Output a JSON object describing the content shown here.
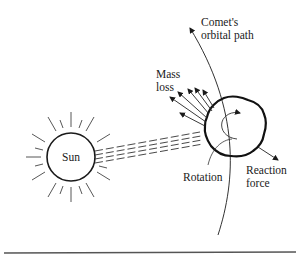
{
  "diagram": {
    "labels": {
      "sun": "Sun",
      "orbital_path_line1": "Comet's",
      "orbital_path_line2": "orbital path",
      "mass_loss_line1": "Mass",
      "mass_loss_line2": "loss",
      "rotation": "Rotation",
      "reaction_line1": "Reaction",
      "reaction_line2": "force"
    },
    "colors": {
      "ink": "#1a1a1a",
      "rule": "#555555",
      "background": "#ffffff"
    }
  }
}
